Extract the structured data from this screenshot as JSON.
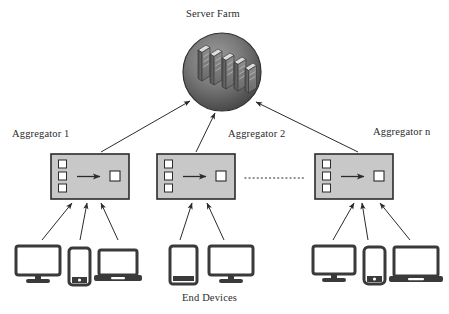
{
  "diagram": {
    "title_node": "Server Farm",
    "bottom_caption": "End Devices",
    "aggregators": [
      {
        "label": "Aggregator 1"
      },
      {
        "label": "Aggregator 2"
      },
      {
        "label": "Aggregator n"
      }
    ],
    "continuation_marker": "dotted-ellipsis",
    "colors": {
      "stroke": "#2b2b2b",
      "aggregator_fill": "#c8c8c8",
      "server_circle_dark": "#4a4a4a",
      "server_circle_light": "#9a9a9a",
      "rack_face": "#7d7d7d",
      "rack_top": "#d9d9d9",
      "rack_side": "#555555",
      "device_stroke": "#3a3a3a",
      "background": "#ffffff",
      "text": "#2b2b2b"
    }
  },
  "nodes": {
    "server_farm": {
      "name": "Server Farm",
      "shape": "circle",
      "rack_count": 5
    },
    "aggregator_internals": {
      "input_port_count": 3,
      "output_port_count": 1,
      "flow_icon": "right-arrow"
    }
  },
  "end_devices": {
    "group_1": [
      "desktop-monitor",
      "smartphone",
      "laptop"
    ],
    "group_2": [
      "tablet",
      "desktop-monitor"
    ],
    "group_3": [
      "desktop-monitor",
      "smartphone",
      "laptop"
    ]
  },
  "edges": {
    "aggregator_to_server_count": 3,
    "devices_to_aggregator": [
      3,
      2,
      3
    ]
  }
}
